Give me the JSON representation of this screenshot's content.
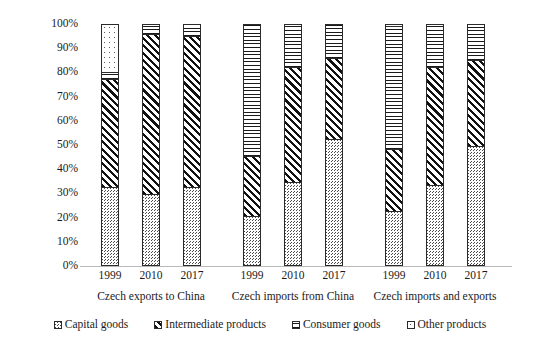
{
  "chart_data": {
    "type": "bar",
    "subtype": "stacked-100-percent",
    "title": "",
    "xlabel": "",
    "ylabel": "",
    "ylim": [
      0,
      100
    ],
    "y_tick_labels": [
      "0%",
      "10%",
      "20%",
      "30%",
      "40%",
      "50%",
      "60%",
      "70%",
      "80%",
      "90%",
      "100%"
    ],
    "y_ticks": [
      0,
      10,
      20,
      30,
      40,
      50,
      60,
      70,
      80,
      90,
      100
    ],
    "grid": false,
    "legend_position": "bottom",
    "categories": [
      "1999",
      "2010",
      "2017",
      "1999",
      "2010",
      "2017",
      "1999",
      "2010",
      "2017"
    ],
    "groups": [
      {
        "label": "Czech exports to China",
        "categories": [
          "1999",
          "2010",
          "2017"
        ]
      },
      {
        "label": "Czech imports from China",
        "categories": [
          "1999",
          "2010",
          "2017"
        ]
      },
      {
        "label": "Czech imports and exports",
        "categories": [
          "1999",
          "2010",
          "2017"
        ]
      }
    ],
    "series": [
      {
        "name": "Capital goods",
        "pattern": "fine-diagonal-grey",
        "values": [
          32,
          29,
          32,
          20,
          34,
          52,
          22,
          33,
          49
        ]
      },
      {
        "name": "Intermediate products",
        "pattern": "bold-diagonal-hatch",
        "values": [
          45,
          67,
          63,
          25,
          48,
          34,
          26,
          49,
          36
        ]
      },
      {
        "name": "Consumer goods",
        "pattern": "horizontal-lines",
        "values": [
          3,
          4,
          5,
          55,
          18,
          14,
          51,
          18,
          15
        ]
      },
      {
        "name": "Other products",
        "pattern": "dotted",
        "values": [
          20,
          0,
          0,
          0,
          0,
          0,
          1,
          0,
          0
        ]
      }
    ]
  },
  "legend": {
    "items": [
      {
        "label": "Capital goods",
        "pattern": "capital"
      },
      {
        "label": "Intermediate products",
        "pattern": "intermediate"
      },
      {
        "label": "Consumer goods",
        "pattern": "consumer"
      },
      {
        "label": "Other products",
        "pattern": "other"
      }
    ]
  }
}
